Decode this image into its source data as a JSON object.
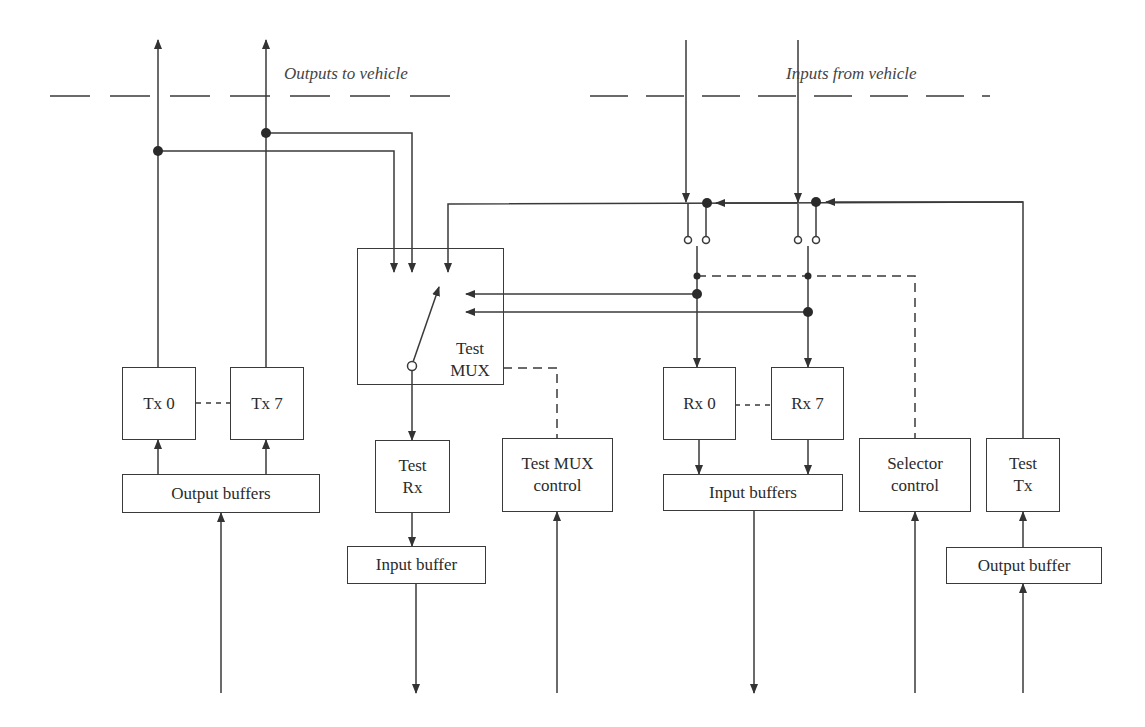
{
  "labels": {
    "outputs_to_vehicle": "Outputs to vehicle",
    "inputs_from_vehicle": "Inputs from vehicle"
  },
  "blocks": {
    "tx0": "Tx 0",
    "tx7": "Tx 7",
    "output_buffers": "Output buffers",
    "test_mux_line1": "Test",
    "test_mux_line2": "MUX",
    "test_rx_line1": "Test",
    "test_rx_line2": "Rx",
    "input_buffer": "Input buffer",
    "test_mux_control_line1": "Test MUX",
    "test_mux_control_line2": "control",
    "rx0": "Rx 0",
    "rx7": "Rx 7",
    "input_buffers": "Input buffers",
    "selector_control_line1": "Selector",
    "selector_control_line2": "control",
    "test_tx_line1": "Test",
    "test_tx_line2": "Tx",
    "output_buffer": "Output buffer"
  },
  "colors": {
    "line": "#3a3a3a",
    "background": "#ffffff"
  }
}
